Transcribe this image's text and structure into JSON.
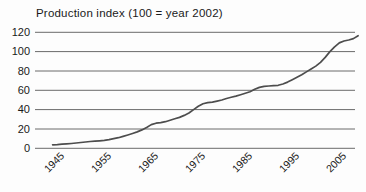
{
  "colors": {
    "background": "#fdfdfd",
    "grid": "#6b6b6b",
    "line": "#4d4d4d",
    "text": "#1a1a1a"
  },
  "chart_data": {
    "type": "line",
    "title": "Production index (100 = year 2002)",
    "xlabel": "",
    "ylabel": "",
    "xlim": [
      1943,
      2008
    ],
    "ylim": [
      0,
      120
    ],
    "grid": "horizontal",
    "legend": "none",
    "x_ticks": [
      1945,
      1955,
      1965,
      1975,
      1985,
      1995,
      2005
    ],
    "y_ticks": [
      0,
      20,
      40,
      60,
      80,
      100,
      120
    ],
    "x": [
      1943,
      1944,
      1945,
      1946,
      1947,
      1948,
      1949,
      1950,
      1951,
      1952,
      1953,
      1954,
      1955,
      1956,
      1957,
      1958,
      1959,
      1960,
      1961,
      1962,
      1963,
      1964,
      1965,
      1966,
      1967,
      1968,
      1969,
      1970,
      1971,
      1972,
      1973,
      1974,
      1975,
      1976,
      1977,
      1978,
      1979,
      1980,
      1981,
      1982,
      1983,
      1984,
      1985,
      1986,
      1987,
      1988,
      1989,
      1990,
      1991,
      1992,
      1993,
      1994,
      1995,
      1996,
      1997,
      1998,
      1999,
      2000,
      2001,
      2002,
      2003,
      2004,
      2005,
      2006,
      2007,
      2008
    ],
    "values": [
      3.6,
      3.8,
      4.2,
      4.6,
      5.0,
      5.5,
      6.0,
      6.5,
      7.0,
      7.3,
      7.8,
      8.3,
      9.0,
      10.0,
      11.0,
      12.3,
      13.8,
      15.3,
      17.0,
      19.0,
      21.5,
      24.5,
      26.0,
      26.6,
      27.5,
      29.0,
      30.5,
      32.0,
      34.0,
      36.5,
      40.0,
      43.5,
      46.0,
      47.3,
      47.8,
      48.8,
      50.0,
      51.5,
      52.8,
      54.0,
      55.5,
      57.0,
      58.5,
      61.0,
      63.0,
      64.0,
      64.5,
      64.8,
      65.2,
      66.5,
      68.5,
      71.0,
      73.5,
      76.0,
      79.0,
      82.0,
      85.0,
      89.0,
      94.0,
      100.0,
      105.0,
      109.0,
      111.0,
      112.0,
      113.5,
      116.5
    ]
  }
}
